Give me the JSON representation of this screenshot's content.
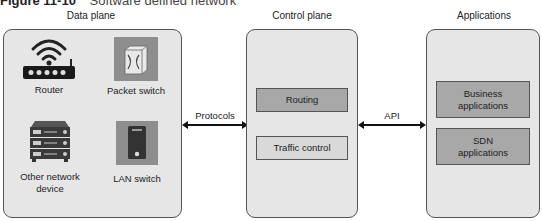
{
  "figure": {
    "number": "Figure 11-10",
    "caption": "Software defined network"
  },
  "planes": {
    "data_plane": {
      "title": "Data plane",
      "devices": [
        {
          "label": "Router",
          "icon": "wifi-router-icon"
        },
        {
          "label": "Packet switch",
          "icon": "packet-switch-icon"
        },
        {
          "label": "Other network device",
          "icon": "server-rack-icon"
        },
        {
          "label": "LAN switch",
          "icon": "lan-switch-icon"
        }
      ]
    },
    "control_plane": {
      "title": "Control plane",
      "boxes": [
        {
          "label": "Routing",
          "shade": "dark"
        },
        {
          "label": "Traffic control",
          "shade": "light"
        }
      ]
    },
    "applications": {
      "title": "Applications",
      "boxes": [
        {
          "label": "Business applications",
          "shade": "dark"
        },
        {
          "label": "SDN applications",
          "shade": "dark"
        }
      ]
    }
  },
  "connectors": [
    {
      "label": "Protocols",
      "from": "Data plane",
      "to": "Control plane",
      "direction": "bidirectional"
    },
    {
      "label": "API",
      "from": "Control plane",
      "to": "Applications",
      "direction": "bidirectional"
    }
  ],
  "colors": {
    "panel_fill": "#e6e6e6",
    "box_dark": "#a8a8a8",
    "box_light": "#d9d9d9",
    "border": "#555555"
  }
}
